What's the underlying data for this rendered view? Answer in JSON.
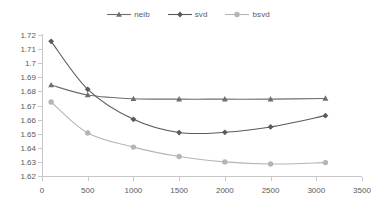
{
  "chart_data": {
    "type": "line",
    "title": "",
    "subtitle": "",
    "xlabel": "",
    "ylabel": "",
    "x": [
      100,
      500,
      1000,
      1500,
      2000,
      2500,
      3100
    ],
    "xlim": [
      0,
      3500
    ],
    "ylim": [
      1.62,
      1.72
    ],
    "xticks": [
      0,
      500,
      1000,
      1500,
      2000,
      2500,
      3000,
      3500
    ],
    "xtick_labels": [
      "0",
      "500",
      "1000",
      "1500",
      "2000",
      "2500",
      "3000",
      "3500"
    ],
    "yticks": [
      1.62,
      1.63,
      1.64,
      1.65,
      1.66,
      1.67,
      1.68,
      1.69,
      1.7,
      1.71,
      1.72
    ],
    "ytick_labels": [
      "1.62",
      "1.63",
      "1.64",
      "1.65",
      "1.66",
      "1.67",
      "1.68",
      "1.69",
      "1.7",
      "1.71",
      "1.72"
    ],
    "grid": false,
    "legend_position": "top-center",
    "series": [
      {
        "name": "neib",
        "marker": "triangle",
        "color": "#6e6e6e",
        "values": [
          1.6845,
          1.6775,
          1.6748,
          1.6745,
          1.6745,
          1.6745,
          1.675
        ]
      },
      {
        "name": "svd",
        "marker": "diamond",
        "color": "#5a5a5a",
        "values": [
          1.7155,
          1.6815,
          1.6602,
          1.6508,
          1.651,
          1.6548,
          1.6628
        ]
      },
      {
        "name": "bsvd",
        "marker": "circle",
        "color": "#b5b5b5",
        "values": [
          1.6725,
          1.6505,
          1.6405,
          1.6338,
          1.63,
          1.6285,
          1.6295
        ]
      }
    ]
  },
  "legend": {
    "items": [
      {
        "label": "neib",
        "marker": "triangle",
        "color": "#6e6e6e"
      },
      {
        "label": "svd",
        "marker": "diamond",
        "color": "#5a5a5a"
      },
      {
        "label": "bsvd",
        "marker": "circle",
        "color": "#b5b5b5"
      }
    ]
  },
  "axes": {
    "y_axis_name": "value-axis",
    "x_axis_name": "category-axis"
  }
}
